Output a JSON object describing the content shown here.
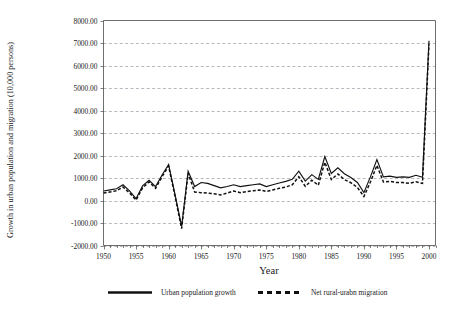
{
  "chart_data": {
    "type": "line",
    "title": "",
    "xlabel": "Year",
    "ylabel": "Growth in urban population and migration (10,000 persons)",
    "xlim": [
      1950,
      2001
    ],
    "ylim": [
      -2000,
      8000
    ],
    "grid": true,
    "legend_position": "bottom",
    "x_tick_labels": [
      "1950",
      "1955",
      "1960",
      "1965",
      "1970",
      "1975",
      "1980",
      "1985",
      "1990",
      "1995",
      "2000"
    ],
    "x_ticks": [
      1950,
      1955,
      1960,
      1965,
      1970,
      1975,
      1980,
      1985,
      1990,
      1995,
      2000
    ],
    "y_tick_labels": [
      "8000.00",
      "7000.00",
      "6000.00",
      "5000.00",
      "4000.00",
      "3000.00",
      "2000.00",
      "1000.00",
      "0.00",
      "-1000.00",
      "-2000.00"
    ],
    "y_ticks": [
      8000,
      7000,
      6000,
      5000,
      4000,
      3000,
      2000,
      1000,
      0,
      -1000,
      -2000
    ],
    "x": [
      1950,
      1951,
      1952,
      1953,
      1954,
      1955,
      1956,
      1957,
      1958,
      1959,
      1960,
      1961,
      1962,
      1963,
      1964,
      1965,
      1966,
      1967,
      1968,
      1969,
      1970,
      1971,
      1972,
      1973,
      1974,
      1975,
      1976,
      1977,
      1978,
      1979,
      1980,
      1981,
      1982,
      1983,
      1984,
      1985,
      1986,
      1987,
      1988,
      1989,
      1990,
      1991,
      1992,
      1993,
      1994,
      1995,
      1996,
      1997,
      1998,
      1999,
      2000
    ],
    "series": [
      {
        "name": "Urban population growth",
        "style": "solid",
        "values": [
          420,
          470,
          520,
          700,
          430,
          80,
          650,
          900,
          620,
          1130,
          1600,
          250,
          -1150,
          1300,
          620,
          800,
          760,
          660,
          560,
          620,
          700,
          620,
          660,
          700,
          740,
          620,
          700,
          780,
          850,
          940,
          1300,
          860,
          1150,
          940,
          1950,
          1200,
          1450,
          1190,
          1020,
          800,
          350,
          1050,
          1820,
          1050,
          1080,
          1030,
          1050,
          1030,
          1120,
          1030,
          7100
        ]
      },
      {
        "name": "Net rural-urabn migration",
        "style": "dashed",
        "values": [
          330,
          380,
          430,
          600,
          330,
          20,
          560,
          830,
          540,
          1060,
          1530,
          170,
          -1250,
          1200,
          380,
          350,
          330,
          300,
          250,
          330,
          420,
          350,
          400,
          430,
          470,
          400,
          470,
          540,
          600,
          700,
          1060,
          630,
          900,
          680,
          1700,
          930,
          1180,
          930,
          790,
          580,
          180,
          820,
          1560,
          820,
          850,
          800,
          800,
          760,
          830,
          760,
          6950
        ]
      }
    ]
  },
  "legend": {
    "items": [
      {
        "label": "Urban population growth",
        "style": "solid"
      },
      {
        "label": "Net rural-urabn migration",
        "style": "dashed"
      }
    ]
  },
  "colors": {
    "series": "#111111",
    "grid": "#9a9aa6",
    "axis": "#4a4a4a",
    "background": "#ffffff"
  }
}
